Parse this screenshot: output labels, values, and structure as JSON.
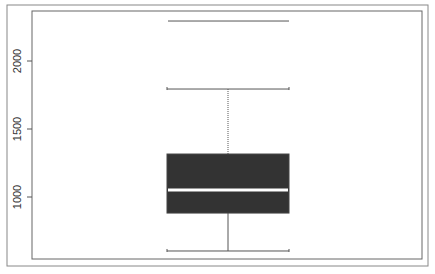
{
  "chart_data": {
    "type": "boxplot",
    "title": "",
    "xlabel": "",
    "ylabel": "",
    "yticks": [
      1000,
      1500,
      2000
    ],
    "ytick_labels": [
      "1000",
      "1500",
      "2000"
    ],
    "ylim": [
      560,
      2340
    ],
    "grid": false,
    "legend": null,
    "series": [
      {
        "name": "",
        "whisker_low": 603,
        "q1": 882,
        "median": 1051,
        "q3": 1316,
        "whisker_high": 1794,
        "outliers": [
          2294
        ]
      }
    ]
  },
  "style": {
    "box_fill": "#333333",
    "median_color": "#ffffff",
    "line_color": "#555555",
    "frame_color": "#777777"
  }
}
